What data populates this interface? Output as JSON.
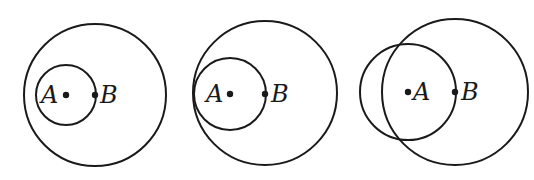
{
  "figures": [
    {
      "id": "fig1",
      "description": "Small circle centered at A passing through B, inside large circle",
      "large_circle": {
        "cx": 95,
        "cy": 95,
        "r": 71
      },
      "small_circle": {
        "cx": 66,
        "cy": 95,
        "r": 30
      },
      "point_a": {
        "x": 66,
        "y": 95,
        "label": "A"
      },
      "point_b": {
        "x": 95,
        "y": 95,
        "label": "B"
      }
    },
    {
      "id": "fig2",
      "description": "Small circle centered at A, internally tangent to large circle centered at B",
      "large_circle": {
        "cx": 265,
        "cy": 93,
        "r": 72
      },
      "small_circle": {
        "cx": 230,
        "cy": 94,
        "r": 36
      },
      "point_a": {
        "x": 230,
        "y": 94,
        "label": "A"
      },
      "point_b": {
        "x": 265,
        "y": 94,
        "label": "B"
      }
    },
    {
      "id": "fig3",
      "description": "Small circle centered at A intersecting large circle centered at B",
      "large_circle": {
        "cx": 455,
        "cy": 92,
        "r": 73
      },
      "small_circle": {
        "cx": 408,
        "cy": 92,
        "r": 48
      },
      "point_a": {
        "x": 408,
        "y": 92,
        "label": "A"
      },
      "point_b": {
        "x": 455,
        "y": 92,
        "label": "B"
      }
    }
  ],
  "stroke_color": "#1a1a1a"
}
